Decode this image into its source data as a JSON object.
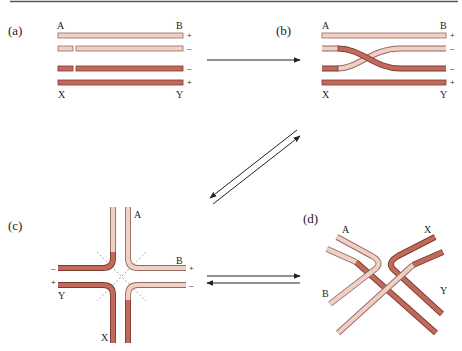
{
  "figure": {
    "top_rule": true,
    "colors": {
      "light_strand": "#f2cfc4",
      "light_outline": "#8f6c63",
      "dark_strand": "#c2695b",
      "dark_outline": "#7a3b31",
      "dashed_line": "#e07a6a",
      "arrow": "#222222"
    },
    "panels": {
      "a": {
        "label": "(a)",
        "top_left": "A",
        "top_right": "B",
        "bottom_left": "X",
        "bottom_right": "Y",
        "signs": [
          "+",
          "–",
          "–",
          "+"
        ]
      },
      "b": {
        "label": "(b)",
        "top_left": "A",
        "top_right": "B",
        "bottom_left": "X",
        "bottom_right": "Y",
        "signs": [
          "+",
          "–",
          "–",
          "+"
        ]
      },
      "c": {
        "label": "(c)",
        "end_A": "A",
        "end_B": "B",
        "end_X": "X",
        "end_Y": "Y",
        "signs": {
          "left_top": "–",
          "left_bottom": "+",
          "right_top": "+",
          "right_bottom": "–"
        }
      },
      "d": {
        "label": "(d)",
        "end_A": "A",
        "end_B": "B",
        "end_X": "X",
        "end_Y": "Y"
      }
    },
    "arrows": [
      {
        "from": "a",
        "to": "b",
        "type": "forward"
      },
      {
        "between": [
          "b",
          "c"
        ],
        "type": "reversible"
      },
      {
        "between": [
          "c",
          "d"
        ],
        "type": "reversible"
      }
    ]
  }
}
